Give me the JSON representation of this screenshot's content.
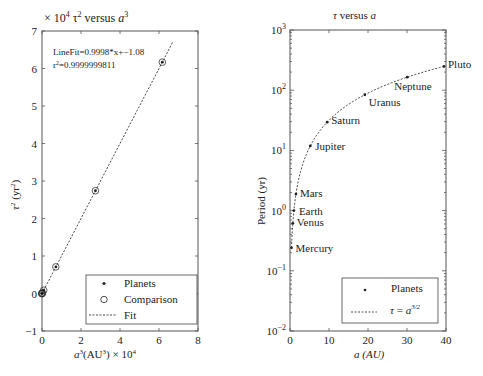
{
  "chart_data": [
    {
      "type": "scatter",
      "title": "× 10^4 τ² versus a³",
      "title_parts": {
        "multiplier": "× 10",
        "multiplier_exp": "4",
        "tau": "τ",
        "tau_exp": "2",
        "versus": " versus ",
        "a": "a",
        "a_exp": "3"
      },
      "xlabel": "a³(AU³) × 10⁴",
      "xlabel_parts": {
        "a": "a",
        "a_exp": "3",
        "unit": "(AU",
        "unit_exp": "3",
        "close": ")",
        "times": " × 10",
        "times_exp": "4"
      },
      "ylabel": "τ² (yr²)",
      "ylabel_parts": {
        "tau": "τ",
        "tau_exp": "2",
        "unit": " (yr",
        "unit_exp": "2",
        "close": ")"
      },
      "xlim": [
        0,
        8
      ],
      "ylim": [
        -1,
        7
      ],
      "xticks": [
        "0",
        "2",
        "4",
        "6",
        "8"
      ],
      "yticks": [
        "-1",
        "0",
        "1",
        "2",
        "3",
        "4",
        "5",
        "6",
        "7"
      ],
      "annotation": [
        "LineFit=0.9998*x+-1.08",
        "r²=0.9999999811"
      ],
      "annotation_parts": {
        "line1": "LineFit=0.9998*x+−1.08",
        "line2a": "r",
        "line2exp": "2",
        "line2b": "=0.9999999811"
      },
      "series": [
        {
          "name": "Planets",
          "marker": "dot",
          "x": [
            0.0,
            0.0,
            0.0,
            0.0,
            0.014,
            0.088,
            0.71,
            2.74,
            6.17
          ],
          "y": [
            0.0,
            0.0,
            0.0,
            0.0,
            0.014,
            0.087,
            0.71,
            2.74,
            6.17
          ]
        },
        {
          "name": "Comparison",
          "marker": "circle",
          "x": [
            0.0,
            0.0,
            0.0,
            0.0,
            0.014,
            0.088,
            0.71,
            2.74,
            6.17
          ],
          "y": [
            0.0,
            0.0,
            0.0,
            0.0,
            0.014,
            0.087,
            0.71,
            2.74,
            6.17
          ]
        },
        {
          "name": "Fit",
          "style": "dashed",
          "x": [
            0,
            6.7
          ],
          "y": [
            -0.00011,
            6.7
          ]
        }
      ],
      "legend": {
        "position": "lower right",
        "entries": [
          "Planets",
          "Comparison",
          "Fit"
        ]
      },
      "grid": false
    },
    {
      "type": "scatter",
      "title": "τ versus a",
      "title_parts": {
        "tau": "τ",
        "versus": " versus ",
        "a": "a"
      },
      "xlabel": "a (AU)",
      "xlabel_parts": {
        "a": "a",
        "unit": " (AU)"
      },
      "ylabel": "Period (yr)",
      "xlim": [
        0,
        40
      ],
      "ylim": [
        0.01,
        1000
      ],
      "yscale": "log",
      "xticks": [
        "0",
        "10",
        "20",
        "30",
        "40"
      ],
      "yticks": [
        {
          "base": "10",
          "exp": "-2"
        },
        {
          "base": "10",
          "exp": "-1"
        },
        {
          "base": "10",
          "exp": "0"
        },
        {
          "base": "10",
          "exp": "1"
        },
        {
          "base": "10",
          "exp": "2"
        },
        {
          "base": "10",
          "exp": "3"
        }
      ],
      "series": [
        {
          "name": "Planets",
          "marker": "dot",
          "points": [
            {
              "label": "Mercury",
              "a": 0.387,
              "period": 0.241
            },
            {
              "label": "Venus",
              "a": 0.723,
              "period": 0.615
            },
            {
              "label": "Earth",
              "a": 1.0,
              "period": 1.0
            },
            {
              "label": "Mars",
              "a": 1.524,
              "period": 1.881
            },
            {
              "label": "Jupiter",
              "a": 5.203,
              "period": 11.86
            },
            {
              "label": "Saturn",
              "a": 9.537,
              "period": 29.45
            },
            {
              "label": "Uranus",
              "a": 19.19,
              "period": 84.02
            },
            {
              "label": "Neptune",
              "a": 30.07,
              "period": 164.8
            },
            {
              "label": "Pluto",
              "a": 39.48,
              "period": 248.0
            }
          ]
        },
        {
          "name": "τ = a^(3/2)",
          "style": "dashed",
          "function": "a^1.5",
          "x_range": [
            0.387,
            39.48
          ]
        }
      ],
      "legend": {
        "position": "lower right",
        "entries": [
          "Planets",
          "τ = a^3/2"
        ],
        "entry2_parts": {
          "tau": "τ",
          "eq": " = ",
          "a": "a",
          "exp": "3/2"
        }
      },
      "grid": false
    }
  ]
}
